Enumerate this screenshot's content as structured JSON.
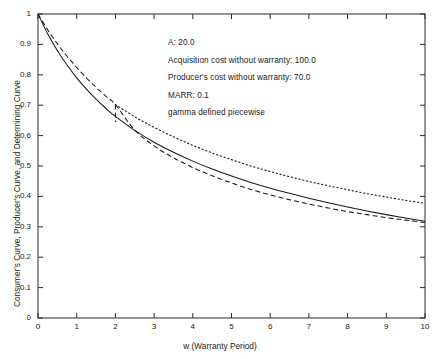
{
  "chart_data": {
    "type": "line",
    "title": "",
    "xlabel": "w (Warranty Period)",
    "ylabel": "Consumer's Curve, Producer's Curve, and Determining Curve",
    "xlim": [
      0,
      10
    ],
    "ylim": [
      0,
      1
    ],
    "grid": false,
    "legend": "none",
    "xticks": [
      "0",
      "1",
      "2",
      "3",
      "4",
      "5",
      "6",
      "7",
      "8",
      "9",
      "10"
    ],
    "yticks": [
      "0",
      "0.1",
      "0.2",
      "0.3",
      "0.4",
      "0.5",
      "0.6",
      "0.7",
      "0.8",
      "0.9",
      "1"
    ],
    "series": [
      {
        "name": "Consumer's Curve",
        "style": "solid",
        "x": [
          0,
          0.25,
          0.5,
          0.75,
          1,
          1.25,
          1.5,
          1.75,
          2,
          2.5,
          3,
          3.5,
          4,
          4.5,
          5,
          5.5,
          6,
          6.5,
          7,
          7.5,
          8,
          8.5,
          9,
          9.5,
          10
        ],
        "y": [
          1.0,
          0.935,
          0.88,
          0.832,
          0.79,
          0.753,
          0.72,
          0.69,
          0.663,
          0.617,
          0.578,
          0.545,
          0.516,
          0.49,
          0.467,
          0.446,
          0.427,
          0.41,
          0.394,
          0.379,
          0.365,
          0.352,
          0.34,
          0.329,
          0.318
        ]
      },
      {
        "name": "Producer's Curve",
        "style": "dashed",
        "x": [
          0,
          0.25,
          0.5,
          0.75,
          1,
          1.25,
          1.5,
          1.75,
          2,
          2.5,
          3,
          3.5,
          4,
          4.5,
          5,
          5.5,
          6,
          6.5,
          7,
          7.5,
          8,
          8.5,
          9,
          9.5,
          10
        ],
        "y": [
          1.0,
          0.948,
          0.902,
          0.861,
          0.824,
          0.79,
          0.759,
          0.73,
          0.702,
          0.618,
          0.566,
          0.527,
          0.495,
          0.468,
          0.444,
          0.423,
          0.405,
          0.389,
          0.375,
          0.362,
          0.35,
          0.34,
          0.33,
          0.322,
          0.314
        ]
      },
      {
        "name": "Determining Curve",
        "style": "dotted",
        "x": [
          2,
          2.5,
          3,
          3.5,
          4,
          4.5,
          5,
          5.5,
          6,
          6.5,
          7,
          7.5,
          8,
          8.5,
          9,
          9.5,
          10
        ],
        "y": [
          0.702,
          0.662,
          0.627,
          0.596,
          0.568,
          0.543,
          0.521,
          0.5,
          0.482,
          0.465,
          0.449,
          0.435,
          0.422,
          0.409,
          0.398,
          0.387,
          0.377
        ]
      }
    ],
    "discontinuity": {
      "x": 2,
      "y_top": 0.702,
      "y_bottom": 0.645,
      "style": "dashed",
      "note": "gamma defined piecewise"
    },
    "annotations": [
      "A: 20.0",
      "Acquisition cost without warranty: 100.0",
      "Producer's cost without warranty: 70.0",
      "MARR: 0.1",
      "gamma defined piecewise"
    ]
  },
  "colors": {
    "ink": "#1a1a1a",
    "axis": "#2b2b2b",
    "background": "#ffffff"
  }
}
